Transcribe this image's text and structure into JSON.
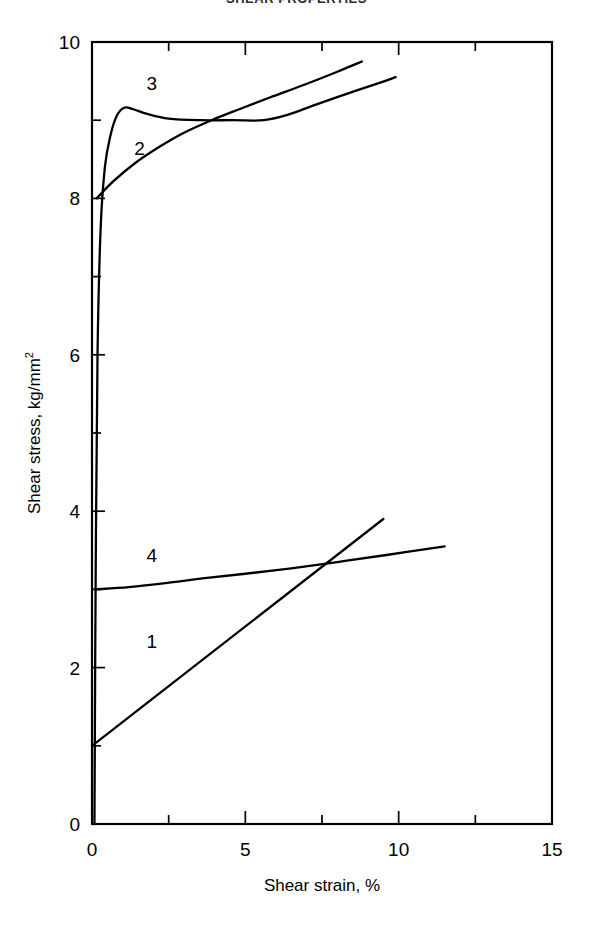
{
  "figure": {
    "clipped_title": "SHEAR PROPERTIES",
    "background_color": "#ffffff",
    "line_color": "#000000"
  },
  "chart_data": {
    "type": "line",
    "title": "",
    "xlabel": "Shear strain, %",
    "ylabel": "Shear stress, kg/mm",
    "ylabel_exponent": "2",
    "ylabel_full": "Shear stress, kg/mm2",
    "xlim": [
      0,
      15
    ],
    "ylim": [
      0,
      10
    ],
    "xticks": [
      0,
      5,
      10,
      15
    ],
    "xticklabels": [
      "0",
      "5",
      "10",
      "15"
    ],
    "x_minor_ticks": [
      2.5,
      7.5,
      12.5
    ],
    "yticks": [
      0,
      2,
      4,
      6,
      8,
      10
    ],
    "yticklabels": [
      "0",
      "2",
      "4",
      "6",
      "8",
      "10"
    ],
    "y_minor_ticks": [
      1,
      3,
      5,
      7,
      9
    ],
    "grid": false,
    "legend": "inline-curve-numbers",
    "series": [
      {
        "name": "1",
        "label": "1",
        "label_x": 1.95,
        "label_y": 2.25,
        "points": [
          [
            0.0,
            1.0
          ],
          [
            9.5,
            3.9
          ]
        ]
      },
      {
        "name": "2",
        "label": "2",
        "label_x": 1.55,
        "label_y": 8.55,
        "points": [
          [
            0.15,
            8.0
          ],
          [
            0.7,
            8.22
          ],
          [
            1.4,
            8.45
          ],
          [
            2.2,
            8.66
          ],
          [
            3.0,
            8.84
          ],
          [
            3.9,
            9.0
          ],
          [
            4.8,
            9.14
          ],
          [
            5.8,
            9.29
          ],
          [
            6.9,
            9.45
          ],
          [
            8.0,
            9.62
          ],
          [
            8.8,
            9.75
          ]
        ]
      },
      {
        "name": "3",
        "label": "3",
        "label_x": 1.95,
        "label_y": 9.38,
        "points": [
          [
            0.08,
            0.0
          ],
          [
            0.12,
            3.2
          ],
          [
            0.18,
            6.0
          ],
          [
            0.28,
            7.6
          ],
          [
            0.42,
            8.4
          ],
          [
            0.6,
            8.8
          ],
          [
            0.8,
            9.05
          ],
          [
            1.05,
            9.16
          ],
          [
            1.35,
            9.14
          ],
          [
            1.8,
            9.08
          ],
          [
            2.5,
            9.02
          ],
          [
            3.5,
            9.0
          ],
          [
            4.6,
            9.0
          ],
          [
            5.6,
            9.0
          ],
          [
            6.4,
            9.07
          ],
          [
            7.3,
            9.2
          ],
          [
            8.4,
            9.35
          ],
          [
            9.4,
            9.48
          ],
          [
            9.9,
            9.55
          ]
        ]
      },
      {
        "name": "4",
        "label": "4",
        "label_x": 1.95,
        "label_y": 3.35,
        "points": [
          [
            0.12,
            3.0
          ],
          [
            1.2,
            3.03
          ],
          [
            2.4,
            3.08
          ],
          [
            3.6,
            3.14
          ],
          [
            5.0,
            3.2
          ],
          [
            6.5,
            3.27
          ],
          [
            8.0,
            3.35
          ],
          [
            9.6,
            3.44
          ],
          [
            11.5,
            3.55
          ]
        ]
      }
    ],
    "annotations": [
      {
        "text": "1",
        "x": 1.95,
        "y": 2.25
      },
      {
        "text": "2",
        "x": 1.55,
        "y": 8.55
      },
      {
        "text": "3",
        "x": 1.95,
        "y": 9.38
      },
      {
        "text": "4",
        "x": 1.95,
        "y": 3.35
      }
    ]
  }
}
